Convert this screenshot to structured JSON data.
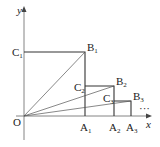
{
  "diagram": {
    "type": "geometry-coordinate-figure",
    "axes": {
      "x_label": "x",
      "y_label": "y",
      "origin_label": "O"
    },
    "points": {
      "C1": {
        "base": "C",
        "sub": "1"
      },
      "B1": {
        "base": "B",
        "sub": "1"
      },
      "A1": {
        "base": "A",
        "sub": "1"
      },
      "C2": {
        "base": "C",
        "sub": "2"
      },
      "B2": {
        "base": "B",
        "sub": "2"
      },
      "A2": {
        "base": "A",
        "sub": "2"
      },
      "C3": {
        "base": "C",
        "sub": "3"
      },
      "B3": {
        "base": "B",
        "sub": "3"
      },
      "A3": {
        "base": "A",
        "sub": "3"
      }
    },
    "continuation": "···",
    "colors": {
      "line": "#333333",
      "axis": "#555555",
      "text": "#222222"
    }
  }
}
